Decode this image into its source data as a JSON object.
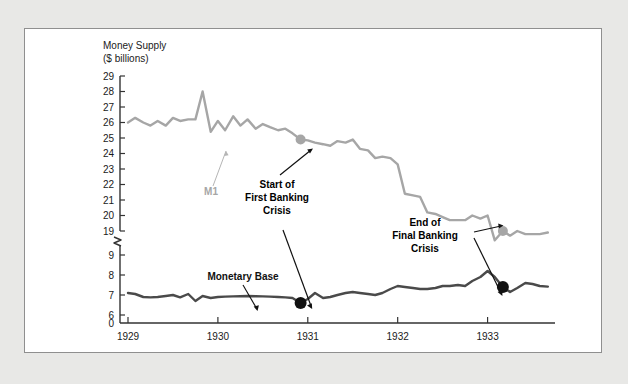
{
  "figure": {
    "background": "#e8e8e6",
    "card_background": "#ffffff",
    "card_border": "#8f8f8f"
  },
  "chart_data": {
    "type": "line",
    "title": "",
    "axis_title_line1": "Money Supply",
    "axis_title_line2": "($ billions)",
    "xlabel": "",
    "ylabel": "Money Supply ($ billions)",
    "grid": false,
    "legend": "inline-labels",
    "axis_break": {
      "present": true,
      "between": [
        9,
        19
      ],
      "symbol": "zigzag"
    },
    "xlim": [
      1929.0,
      1933.75
    ],
    "x_tick_labels": [
      "1929",
      "1930",
      "1931",
      "1932",
      "1933"
    ],
    "x_ticks": [
      1929,
      1930,
      1931,
      1932,
      1933
    ],
    "y_upper_ticks": [
      19,
      20,
      21,
      22,
      23,
      24,
      25,
      26,
      27,
      28,
      29
    ],
    "y_lower_ticks": [
      0,
      6,
      7,
      8,
      9
    ],
    "y_upper_range": [
      19,
      29
    ],
    "y_lower_range": [
      6,
      9
    ],
    "series": [
      {
        "name": "M1",
        "color": "#a6a6a6",
        "label": "M1",
        "axis": "upper",
        "x": [
          1929.0,
          1929.08,
          1929.17,
          1929.25,
          1929.33,
          1929.42,
          1929.5,
          1929.58,
          1929.67,
          1929.75,
          1929.83,
          1929.92,
          1930.0,
          1930.08,
          1930.17,
          1930.25,
          1930.33,
          1930.42,
          1930.5,
          1930.58,
          1930.67,
          1930.75,
          1930.83,
          1930.92,
          1931.0,
          1931.08,
          1931.17,
          1931.25,
          1931.33,
          1931.42,
          1931.5,
          1931.58,
          1931.67,
          1931.75,
          1931.83,
          1931.92,
          1932.0,
          1932.08,
          1932.17,
          1932.25,
          1932.33,
          1932.42,
          1932.5,
          1932.58,
          1932.67,
          1932.75,
          1932.83,
          1932.92,
          1933.0,
          1933.08,
          1933.17,
          1933.25,
          1933.33,
          1933.42,
          1933.5,
          1933.58,
          1933.67
        ],
        "y": [
          26.0,
          26.3,
          26.0,
          25.8,
          26.1,
          25.8,
          26.3,
          26.1,
          26.2,
          26.2,
          28.0,
          25.4,
          26.1,
          25.5,
          26.4,
          25.8,
          26.2,
          25.6,
          25.9,
          25.7,
          25.5,
          25.6,
          25.3,
          24.9,
          24.85,
          24.7,
          24.6,
          24.5,
          24.8,
          24.7,
          24.9,
          24.3,
          24.2,
          23.7,
          23.8,
          23.7,
          23.3,
          21.4,
          21.3,
          21.2,
          20.2,
          20.1,
          19.9,
          19.7,
          19.7,
          19.7,
          20.0,
          19.8,
          20.0,
          18.4,
          19.0,
          18.7,
          19.0,
          18.8,
          18.8,
          18.8,
          18.9
        ],
        "markers": [
          {
            "x": 1930.92,
            "y": 24.9,
            "color": "#a6a6a6",
            "size": 5
          },
          {
            "x": 1933.17,
            "y": 19.0,
            "color": "#a6a6a6",
            "size": 5
          }
        ]
      },
      {
        "name": "Monetary Base",
        "color": "#4a4a4a",
        "label": "Monetary Base",
        "axis": "lower",
        "x": [
          1929.0,
          1929.08,
          1929.17,
          1929.25,
          1929.33,
          1929.42,
          1929.5,
          1929.58,
          1929.67,
          1929.75,
          1929.83,
          1929.92,
          1930.0,
          1930.08,
          1930.17,
          1930.25,
          1930.33,
          1930.42,
          1930.5,
          1930.58,
          1930.67,
          1930.75,
          1930.83,
          1930.92,
          1931.0,
          1931.08,
          1931.17,
          1931.25,
          1931.33,
          1931.42,
          1931.5,
          1931.58,
          1931.67,
          1931.75,
          1931.83,
          1931.92,
          1932.0,
          1932.08,
          1932.17,
          1932.25,
          1932.33,
          1932.42,
          1932.5,
          1932.58,
          1932.67,
          1932.75,
          1932.83,
          1932.92,
          1933.0,
          1933.08,
          1933.17,
          1933.25,
          1933.33,
          1933.42,
          1933.5,
          1933.58,
          1933.67
        ],
        "y": [
          7.1,
          7.05,
          6.9,
          6.88,
          6.9,
          6.95,
          7.0,
          6.88,
          7.05,
          6.7,
          6.95,
          6.85,
          6.9,
          6.92,
          6.93,
          6.94,
          6.95,
          6.94,
          6.93,
          6.92,
          6.9,
          6.88,
          6.85,
          6.6,
          6.8,
          7.1,
          6.85,
          6.9,
          7.0,
          7.1,
          7.15,
          7.1,
          7.05,
          7.0,
          7.1,
          7.3,
          7.45,
          7.4,
          7.35,
          7.3,
          7.3,
          7.35,
          7.45,
          7.45,
          7.5,
          7.45,
          7.7,
          7.9,
          8.2,
          7.9,
          7.4,
          7.15,
          7.35,
          7.6,
          7.55,
          7.45,
          7.42
        ],
        "markers": [
          {
            "x": 1930.92,
            "y": 6.6,
            "color": "#111111",
            "size": 6
          },
          {
            "x": 1933.17,
            "y": 7.4,
            "color": "#111111",
            "size": 6
          }
        ]
      }
    ],
    "annotations": [
      {
        "id": "start-first-banking-crisis",
        "lines": [
          "Start of",
          "First Banking",
          "Crisis"
        ],
        "text": "Start of First Banking Crisis",
        "points_to": [
          "M1 1930.92 = 24.9",
          "Monetary Base 1930.92 = 6.6"
        ]
      },
      {
        "id": "end-final-banking-crisis",
        "lines": [
          "End of",
          "Final Banking",
          "Crisis"
        ],
        "text": "End of Final Banking Crisis",
        "points_to": [
          "M1 1933.17 = 19.0",
          "Monetary Base 1933.17 = 7.4"
        ]
      }
    ]
  }
}
